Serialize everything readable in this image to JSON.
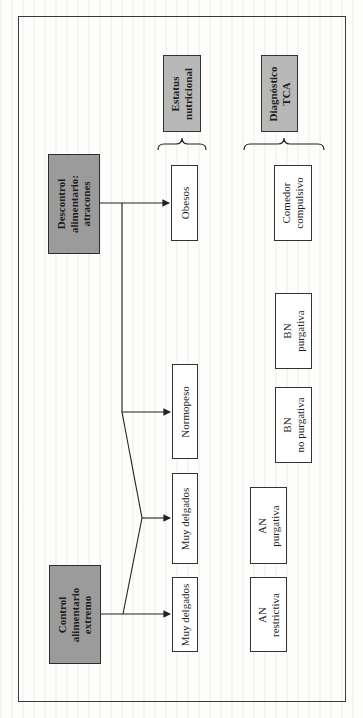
{
  "diagram": {
    "orientation": "rotated -90deg (text reads bottom-to-top)",
    "sources": [
      {
        "id": "descontrol",
        "lines": [
          "Descontrol",
          "alimentario:",
          "atracones"
        ]
      },
      {
        "id": "control",
        "lines": [
          "Control",
          "alimentario",
          "extremo"
        ]
      }
    ],
    "column_headers": [
      {
        "id": "estatus",
        "lines": [
          "Estatus",
          "nutricional"
        ]
      },
      {
        "id": "diagnostico",
        "lines": [
          "Diagnóstico",
          "TCA"
        ]
      }
    ],
    "nutritional_status": [
      {
        "id": "obesos",
        "lines": [
          "Obesos"
        ]
      },
      {
        "id": "normopeso",
        "lines": [
          "Normopeso"
        ]
      },
      {
        "id": "muy-delgados-1",
        "lines": [
          "Muy delgados"
        ]
      },
      {
        "id": "muy-delgados-2",
        "lines": [
          "Muy delgados"
        ]
      }
    ],
    "diagnoses": [
      {
        "id": "comedor",
        "lines": [
          "Comedor",
          "compulsivo"
        ]
      },
      {
        "id": "bn-purgativa",
        "lines": [
          "BN",
          "purgativa"
        ]
      },
      {
        "id": "bn-no-purgativa",
        "lines": [
          "BN",
          "no purgativa"
        ]
      },
      {
        "id": "an-purgativa",
        "lines": [
          "AN",
          "purgativa"
        ]
      },
      {
        "id": "an-restrictiva",
        "lines": [
          "AN",
          "restrictiva"
        ]
      }
    ],
    "edges": [
      {
        "from": "Descontrol alimentario: atracones",
        "to": "Obesos"
      },
      {
        "from": "Descontrol alimentario: atracones",
        "to": "Normopeso"
      },
      {
        "from": "Control alimentario extremo",
        "to": "Muy delgados (upper)"
      },
      {
        "from": "Control alimentario extremo",
        "to": "Muy delgados (lower)"
      }
    ]
  },
  "colors": {
    "source_fill": "#9b9b9b",
    "header_fill": "#b8b8b8",
    "box_fill": "#ffffff",
    "line": "#222222"
  }
}
